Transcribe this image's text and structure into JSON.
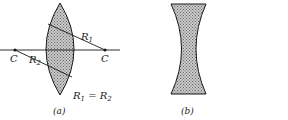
{
  "figure": {
    "panel_a": {
      "caption": "(a)",
      "lens_type": "biconvex",
      "center_left_label": "C",
      "center_right_label": "C",
      "radius1_label": "R",
      "radius1_sub": "1",
      "radius2_label": "R",
      "radius2_sub": "2",
      "equation": {
        "lhs": "R",
        "lhs_sub": "1",
        "op": " = ",
        "rhs": "R",
        "rhs_sub": "2"
      }
    },
    "panel_b": {
      "caption": "(b)",
      "lens_type": "biconcave"
    },
    "colors": {
      "ink": "#1a1a1a",
      "fill_dots": "#9a9a9a"
    }
  }
}
